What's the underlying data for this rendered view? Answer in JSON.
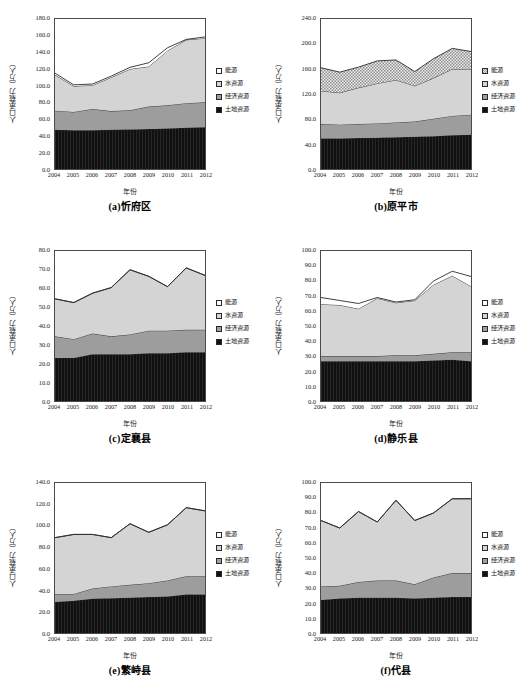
{
  "figure": {
    "panel_count": 6,
    "x_axis_label": "年份",
    "y_axis_label": "人口承载力（万人）",
    "year_ticks": [
      "2004",
      "2005",
      "2006",
      "2007",
      "2008",
      "2009",
      "2010",
      "2011",
      "2012"
    ],
    "legend": [
      {
        "name": "energy",
        "label": "能源",
        "color": "#ffffff"
      },
      {
        "name": "water",
        "label": "水资源",
        "color": "#d4d4d4"
      },
      {
        "name": "economic",
        "label": "经济资源",
        "color": "#9d9d9d"
      },
      {
        "name": "land",
        "label": "土地资源",
        "color": "#121212"
      }
    ]
  },
  "chart_data": [
    {
      "type": "area",
      "panel": "a",
      "title": "(a)忻府区",
      "xlabel": "年份",
      "ylabel": "人口承载力（万人）",
      "x": [
        2004,
        2005,
        2006,
        2007,
        2008,
        2009,
        2010,
        2011,
        2012
      ],
      "ylim": [
        0,
        180
      ],
      "yticks": [
        0.0,
        20.0,
        40.0,
        60.0,
        80.0,
        100.0,
        120.0,
        140.0,
        160.0,
        180.0
      ],
      "ytick_labels": [
        "0.0",
        "20.0",
        "40.0",
        "60.0",
        "80.0",
        "100.0",
        "120.0",
        "140.0",
        "160.0",
        "180.0"
      ],
      "stacked": true,
      "grid": false,
      "legend_position": "right",
      "series": [
        {
          "name": "土地资源",
          "values": [
            47.0,
            46.5,
            46.5,
            47.0,
            47.5,
            48.0,
            48.5,
            49.5,
            50.0
          ]
        },
        {
          "name": "经济资源",
          "values": [
            23.0,
            22.0,
            25.5,
            22.5,
            23.0,
            27.0,
            28.0,
            29.5,
            30.0
          ]
        },
        {
          "name": "水资源",
          "values": [
            43.0,
            31.0,
            28.5,
            40.5,
            49.5,
            48.0,
            65.5,
            76.0,
            77.0
          ]
        },
        {
          "name": "能源",
          "values": [
            2.0,
            1.5,
            1.5,
            1.5,
            2.0,
            4.5,
            3.5,
            0.5,
            1.5
          ]
        }
      ]
    },
    {
      "type": "area",
      "panel": "b",
      "title": "(b)原平市",
      "xlabel": "年份",
      "ylabel": "人口承载力（万人）",
      "x": [
        2004,
        2005,
        2006,
        2007,
        2008,
        2009,
        2010,
        2011,
        2012
      ],
      "ylim": [
        0,
        240
      ],
      "yticks": [
        0.0,
        40.0,
        80.0,
        120.0,
        160.0,
        200.0,
        240.0
      ],
      "ytick_labels": [
        "0.0",
        "40.0",
        "80.0",
        "120.0",
        "160.0",
        "200.0",
        "240.0"
      ],
      "stacked": true,
      "grid": false,
      "legend_position": "right",
      "series": [
        {
          "name": "土地资源",
          "values": [
            49.0,
            49.0,
            49.5,
            50.0,
            51.0,
            51.5,
            52.5,
            54.0,
            55.0
          ]
        },
        {
          "name": "经济资源",
          "values": [
            23.0,
            22.0,
            22.5,
            23.0,
            23.5,
            24.5,
            28.0,
            31.0,
            32.0
          ]
        },
        {
          "name": "水资源",
          "values": [
            53.0,
            51.0,
            58.0,
            64.0,
            68.0,
            57.0,
            65.0,
            75.0,
            73.0
          ]
        },
        {
          "name": "能源",
          "values": [
            37.0,
            33.0,
            33.0,
            36.0,
            32.0,
            23.0,
            31.0,
            33.0,
            28.0
          ]
        }
      ]
    },
    {
      "type": "area",
      "panel": "c",
      "title": "(c)定襄县",
      "xlabel": "年份",
      "ylabel": "人口承载力（万人）",
      "x": [
        2004,
        2005,
        2006,
        2007,
        2008,
        2009,
        2010,
        2011,
        2012
      ],
      "ylim": [
        0,
        80
      ],
      "yticks": [
        0.0,
        10.0,
        20.0,
        30.0,
        40.0,
        50.0,
        60.0,
        70.0,
        80.0
      ],
      "ytick_labels": [
        "0.0",
        "10.0",
        "20.0",
        "30.0",
        "40.0",
        "50.0",
        "60.0",
        "70.0",
        "80.0"
      ],
      "stacked": true,
      "grid": false,
      "legend_position": "right",
      "series": [
        {
          "name": "土地资源",
          "values": [
            23.0,
            23.0,
            25.0,
            25.0,
            25.0,
            25.5,
            25.5,
            26.0,
            26.0
          ]
        },
        {
          "name": "经济资源",
          "values": [
            11.5,
            10.0,
            11.0,
            9.5,
            10.5,
            12.0,
            12.0,
            12.0,
            12.0
          ]
        },
        {
          "name": "水资源",
          "values": [
            20.0,
            19.5,
            21.5,
            26.0,
            34.5,
            29.0,
            23.5,
            33.0,
            29.0
          ]
        },
        {
          "name": "能源",
          "values": [
            0.0,
            0.0,
            0.0,
            0.0,
            0.0,
            0.0,
            0.0,
            0.0,
            0.0
          ]
        }
      ]
    },
    {
      "type": "area",
      "panel": "d",
      "title": "(d)静乐县",
      "xlabel": "年份",
      "ylabel": "人口承载力（万人）",
      "x": [
        2004,
        2005,
        2006,
        2007,
        2008,
        2009,
        2010,
        2011,
        2012
      ],
      "ylim": [
        0,
        100
      ],
      "yticks": [
        0.0,
        10.0,
        20.0,
        30.0,
        40.0,
        50.0,
        60.0,
        70.0,
        80.0,
        90.0,
        100.0
      ],
      "ytick_labels": [
        "0.0",
        "10.0",
        "20.0",
        "30.0",
        "40.0",
        "50.0",
        "60.0",
        "70.0",
        "80.0",
        "90.0",
        "100.0"
      ],
      "stacked": true,
      "grid": false,
      "legend_position": "right",
      "series": [
        {
          "name": "土地资源",
          "values": [
            26.5,
            26.5,
            26.5,
            26.5,
            26.5,
            26.5,
            27.0,
            27.5,
            26.5
          ]
        },
        {
          "name": "经济资源",
          "values": [
            3.5,
            3.5,
            3.5,
            3.5,
            4.0,
            4.0,
            4.5,
            5.0,
            6.0
          ]
        },
        {
          "name": "水资源",
          "values": [
            34.5,
            34.0,
            31.5,
            38.5,
            35.0,
            36.5,
            46.0,
            51.0,
            44.0
          ]
        },
        {
          "name": "能源",
          "values": [
            4.5,
            3.0,
            3.5,
            0.5,
            0.5,
            0.5,
            2.5,
            3.0,
            6.5
          ]
        }
      ]
    },
    {
      "type": "area",
      "panel": "e",
      "title": "(e)繁峙县",
      "xlabel": "年份",
      "ylabel": "人口承载力（万人）",
      "x": [
        2004,
        2005,
        2006,
        2007,
        2008,
        2009,
        2010,
        2011,
        2012
      ],
      "ylim": [
        0,
        140
      ],
      "yticks": [
        0.0,
        20.0,
        40.0,
        60.0,
        80.0,
        100.0,
        120.0,
        140.0
      ],
      "ytick_labels": [
        "0.0",
        "20.0",
        "40.0",
        "60.0",
        "80.0",
        "100.0",
        "120.0",
        "140.0"
      ],
      "stacked": true,
      "grid": false,
      "legend_position": "right",
      "series": [
        {
          "name": "土地资源",
          "values": [
            29.0,
            30.0,
            32.0,
            32.5,
            33.0,
            33.5,
            34.0,
            36.0,
            36.0
          ]
        },
        {
          "name": "经济资源",
          "values": [
            7.5,
            6.5,
            9.5,
            11.0,
            12.0,
            13.0,
            15.0,
            17.0,
            17.0
          ]
        },
        {
          "name": "水资源",
          "values": [
            52.5,
            55.5,
            50.5,
            45.5,
            57.0,
            47.5,
            52.0,
            64.0,
            61.0
          ]
        },
        {
          "name": "能源",
          "values": [
            0.0,
            0.0,
            0.0,
            0.0,
            0.0,
            0.0,
            0.0,
            0.0,
            0.0
          ]
        }
      ]
    },
    {
      "type": "area",
      "panel": "f",
      "title": "(f)代县",
      "xlabel": "年份",
      "ylabel": "人口承载力（万人）",
      "x": [
        2004,
        2005,
        2006,
        2007,
        2008,
        2009,
        2010,
        2011,
        2012
      ],
      "ylim": [
        0,
        100
      ],
      "yticks": [
        0.0,
        10.0,
        20.0,
        30.0,
        40.0,
        50.0,
        60.0,
        70.0,
        80.0,
        90.0,
        100.0
      ],
      "ytick_labels": [
        "0.0",
        "10.0",
        "20.0",
        "30.0",
        "40.0",
        "50.0",
        "60.0",
        "70.0",
        "80.0",
        "90.0",
        "100.0"
      ],
      "stacked": true,
      "grid": false,
      "legend_position": "right",
      "series": [
        {
          "name": "土地资源",
          "values": [
            22.0,
            23.0,
            23.5,
            23.5,
            23.5,
            23.0,
            23.5,
            24.0,
            24.0
          ]
        },
        {
          "name": "经济资源",
          "values": [
            9.0,
            8.5,
            10.5,
            11.5,
            11.5,
            9.5,
            13.5,
            16.0,
            16.0
          ]
        },
        {
          "name": "水资源",
          "values": [
            44.0,
            38.5,
            47.0,
            39.0,
            53.5,
            42.5,
            43.0,
            49.5,
            49.5
          ]
        },
        {
          "name": "能源",
          "values": [
            0.0,
            0.0,
            0.0,
            0.0,
            0.0,
            0.0,
            0.0,
            0.0,
            0.0
          ]
        }
      ]
    }
  ]
}
